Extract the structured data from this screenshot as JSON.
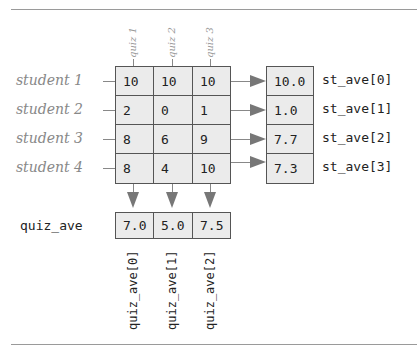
{
  "diagram": {
    "quiz_headers": [
      "quiz 1",
      "quiz 2",
      "quiz 3"
    ],
    "student_labels": [
      "student 1",
      "student 2",
      "student 3",
      "student 4"
    ],
    "scores": [
      [
        "10",
        "10",
        "10"
      ],
      [
        "2",
        "0",
        "1"
      ],
      [
        "8",
        "6",
        "9"
      ],
      [
        "8",
        "4",
        "10"
      ]
    ],
    "st_ave": {
      "values": [
        "10.0",
        "1.0",
        "7.7",
        "7.3"
      ],
      "labels": [
        "st_ave[0]",
        "st_ave[1]",
        "st_ave[2]",
        "st_ave[3]"
      ]
    },
    "quiz_ave": {
      "label": "quiz_ave",
      "values": [
        "7.0",
        "5.0",
        "7.5"
      ],
      "labels": [
        "quiz_ave[0]",
        "quiz_ave[1]",
        "quiz_ave[2]"
      ]
    }
  }
}
